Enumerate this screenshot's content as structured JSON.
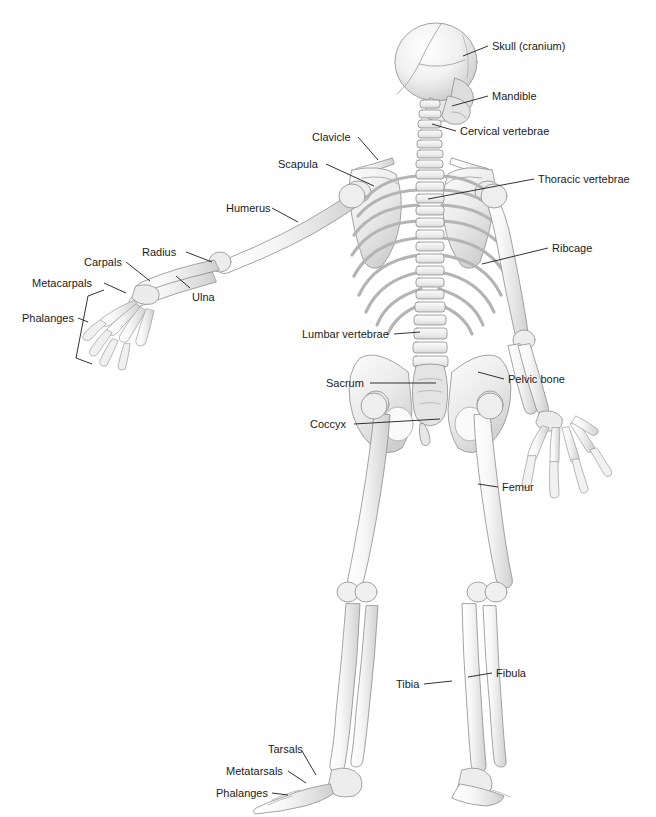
{
  "figure": {
    "view": "posterior",
    "background_color": "#ffffff",
    "bone_fill": "#f2f2f2",
    "bone_shade": "#d8d8d8",
    "outline_color": "#8d8d8d",
    "leader_color": "#1b1b1b",
    "label_color": "#1b1b1b"
  },
  "labels": [
    {
      "id": "skull",
      "text": "Skull (cranium)",
      "x": 492,
      "y": 40,
      "align": "left",
      "leader": [
        [
          488,
          46
        ],
        [
          463,
          56
        ]
      ]
    },
    {
      "id": "mandible",
      "text": "Mandible",
      "x": 492,
      "y": 90,
      "align": "left",
      "leader": [
        [
          488,
          96
        ],
        [
          452,
          106
        ]
      ]
    },
    {
      "id": "cervical",
      "text": "Cervical vertebrae",
      "x": 460,
      "y": 125,
      "align": "left",
      "leader": [
        [
          456,
          131
        ],
        [
          432,
          124
        ]
      ]
    },
    {
      "id": "clavicle",
      "text": "Clavicle",
      "x": 312,
      "y": 131,
      "align": "left",
      "leader": [
        [
          358,
          137
        ],
        [
          378,
          160
        ]
      ]
    },
    {
      "id": "scapula",
      "text": "Scapula",
      "x": 278,
      "y": 158,
      "align": "left",
      "leader": [
        [
          326,
          164
        ],
        [
          374,
          186
        ]
      ]
    },
    {
      "id": "thoracic",
      "text": "Thoracic vertebrae",
      "x": 538,
      "y": 173,
      "align": "left",
      "leader": [
        [
          534,
          179
        ],
        [
          428,
          199
        ]
      ]
    },
    {
      "id": "humerus",
      "text": "Humerus",
      "x": 226,
      "y": 202,
      "align": "left",
      "leader": [
        [
          272,
          208
        ],
        [
          298,
          222
        ]
      ]
    },
    {
      "id": "ribcage",
      "text": "Ribcage",
      "x": 552,
      "y": 242,
      "align": "left",
      "leader": [
        [
          548,
          248
        ],
        [
          482,
          264
        ]
      ]
    },
    {
      "id": "radius",
      "text": "Radius",
      "x": 142,
      "y": 246,
      "align": "left",
      "leader": [
        [
          186,
          252
        ],
        [
          212,
          262
        ]
      ]
    },
    {
      "id": "carpals",
      "text": "Carpals",
      "x": 84,
      "y": 256,
      "align": "left",
      "leader": [
        [
          126,
          262
        ],
        [
          150,
          281
        ]
      ]
    },
    {
      "id": "metacarpals",
      "text": "Metacarpals",
      "x": 32,
      "y": 277,
      "align": "left",
      "leader": [
        [
          104,
          283
        ],
        [
          126,
          293
        ]
      ]
    },
    {
      "id": "ulna",
      "text": "Ulna",
      "x": 192,
      "y": 291,
      "align": "left",
      "leader": [
        [
          190,
          288
        ],
        [
          176,
          276
        ]
      ]
    },
    {
      "id": "phalanges_hand",
      "text": "Phalanges",
      "x": 22,
      "y": 312,
      "align": "left",
      "leader": [
        [
          78,
          318
        ],
        [
          88,
          322
        ]
      ]
    },
    {
      "id": "lumbar",
      "text": "Lumbar vertebrae",
      "x": 302,
      "y": 328,
      "align": "left",
      "leader": [
        [
          394,
          334
        ],
        [
          420,
          332
        ]
      ]
    },
    {
      "id": "sacrum",
      "text": "Sacrum",
      "x": 326,
      "y": 377,
      "align": "left",
      "leader": [
        [
          370,
          383
        ],
        [
          436,
          383
        ]
      ]
    },
    {
      "id": "pelvic_bone",
      "text": "Pelvic bone",
      "x": 508,
      "y": 373,
      "align": "left",
      "leader": [
        [
          504,
          379
        ],
        [
          478,
          372
        ]
      ]
    },
    {
      "id": "coccyx",
      "text": "Coccyx",
      "x": 310,
      "y": 418,
      "align": "left",
      "leader": [
        [
          354,
          424
        ],
        [
          440,
          419
        ]
      ]
    },
    {
      "id": "femur",
      "text": "Femur",
      "x": 502,
      "y": 481,
      "align": "left",
      "leader": [
        [
          498,
          487
        ],
        [
          478,
          484
        ]
      ]
    },
    {
      "id": "fibula",
      "text": "Fibula",
      "x": 496,
      "y": 667,
      "align": "left",
      "leader": [
        [
          492,
          673
        ],
        [
          468,
          677
        ]
      ]
    },
    {
      "id": "tibia",
      "text": "Tibia",
      "x": 396,
      "y": 678,
      "align": "left",
      "leader": [
        [
          424,
          684
        ],
        [
          452,
          681
        ]
      ]
    },
    {
      "id": "tarsals",
      "text": "Tarsals",
      "x": 268,
      "y": 743,
      "align": "left",
      "leader": [
        [
          302,
          751
        ],
        [
          316,
          775
        ]
      ]
    },
    {
      "id": "metatarsals",
      "text": "Metatarsals",
      "x": 226,
      "y": 765,
      "align": "left",
      "leader": [
        [
          288,
          771
        ],
        [
          306,
          783
        ]
      ]
    },
    {
      "id": "phalanges_foot",
      "text": "Phalanges",
      "x": 216,
      "y": 787,
      "align": "left",
      "leader": [
        [
          272,
          793
        ],
        [
          288,
          795
        ]
      ]
    }
  ]
}
